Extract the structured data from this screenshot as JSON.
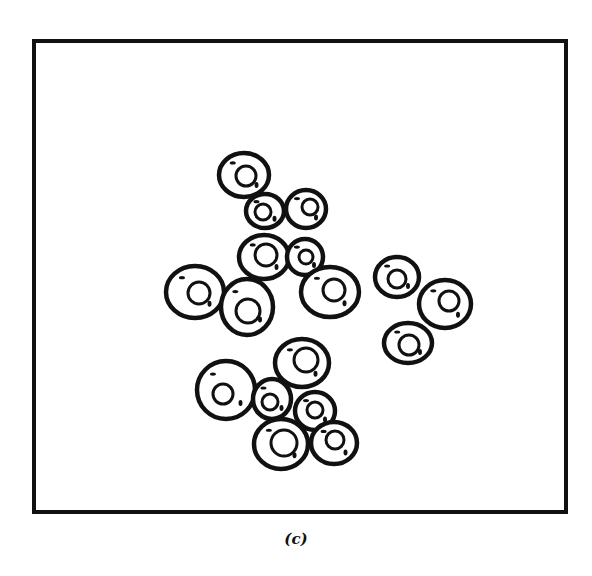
{
  "figure": {
    "caption": "(c)",
    "frame": {
      "x": 34,
      "y": 41,
      "w": 532,
      "h": 471,
      "stroke": "#111111",
      "stroke_width": 4
    },
    "ink_color": "#111111",
    "cells": [
      {
        "cx": 244,
        "cy": 175,
        "rx": 25,
        "ry": 22,
        "nx": 246,
        "ny": 176,
        "nr": 10
      },
      {
        "cx": 265,
        "cy": 211,
        "rx": 19,
        "ry": 17,
        "nx": 263,
        "ny": 212,
        "nr": 8
      },
      {
        "cx": 306,
        "cy": 209,
        "rx": 20,
        "ry": 19,
        "nx": 310,
        "ny": 207,
        "nr": 8
      },
      {
        "cx": 264,
        "cy": 257,
        "rx": 25,
        "ry": 22,
        "nx": 266,
        "ny": 255,
        "nr": 11
      },
      {
        "cx": 305,
        "cy": 257,
        "rx": 18,
        "ry": 18,
        "nx": 306,
        "ny": 257,
        "nr": 7
      },
      {
        "cx": 195,
        "cy": 292,
        "rx": 29,
        "ry": 26,
        "nx": 199,
        "ny": 293,
        "nr": 11
      },
      {
        "cx": 247,
        "cy": 307,
        "rx": 26,
        "ry": 28,
        "nx": 248,
        "ny": 311,
        "nr": 12
      },
      {
        "cx": 330,
        "cy": 292,
        "rx": 29,
        "ry": 25,
        "nx": 334,
        "ny": 290,
        "nr": 11
      },
      {
        "cx": 397,
        "cy": 277,
        "rx": 22,
        "ry": 20,
        "nx": 397,
        "ny": 279,
        "nr": 9
      },
      {
        "cx": 445,
        "cy": 304,
        "rx": 26,
        "ry": 24,
        "nx": 449,
        "ny": 301,
        "nr": 10
      },
      {
        "cx": 408,
        "cy": 343,
        "rx": 24,
        "ry": 20,
        "nx": 409,
        "ny": 345,
        "nr": 10
      },
      {
        "cx": 302,
        "cy": 363,
        "rx": 27,
        "ry": 24,
        "nx": 306,
        "ny": 360,
        "nr": 12
      },
      {
        "cx": 226,
        "cy": 390,
        "rx": 29,
        "ry": 29,
        "nx": 223,
        "ny": 394,
        "nr": 10
      },
      {
        "cx": 272,
        "cy": 399,
        "rx": 19,
        "ry": 20,
        "nx": 270,
        "ny": 402,
        "nr": 8
      },
      {
        "cx": 315,
        "cy": 411,
        "rx": 20,
        "ry": 19,
        "nx": 315,
        "ny": 410,
        "nr": 8
      },
      {
        "cx": 281,
        "cy": 444,
        "rx": 27,
        "ry": 25,
        "nx": 284,
        "ny": 443,
        "nr": 13
      },
      {
        "cx": 334,
        "cy": 443,
        "rx": 23,
        "ry": 21,
        "nx": 335,
        "ny": 440,
        "nr": 9
      }
    ]
  }
}
